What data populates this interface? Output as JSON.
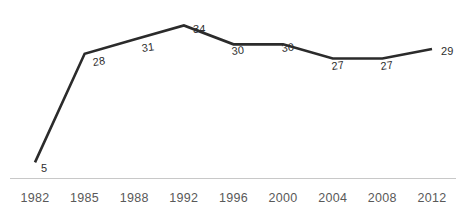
{
  "chart_data": {
    "type": "line",
    "title": "",
    "subtitle": "",
    "xlabel": "",
    "ylabel": "",
    "categories": [
      "1982",
      "1985",
      "1988",
      "1992",
      "1996",
      "2000",
      "2004",
      "2008",
      "2012"
    ],
    "values": [
      5,
      28,
      31,
      34,
      30,
      30,
      27,
      27,
      29
    ],
    "point_labels": [
      "5",
      "28",
      "31",
      "34",
      "30",
      "30",
      "27",
      "27",
      "29"
    ],
    "series": [
      {
        "name": "",
        "values": [
          5,
          28,
          31,
          34,
          30,
          30,
          27,
          27,
          29
        ]
      }
    ],
    "ylim": [
      0,
      36
    ],
    "grid": false,
    "legend": "none",
    "show_y_axis": false,
    "show_x_axis": true,
    "line_color": "#2b2b2b",
    "label_color": "#2e2e2e",
    "tick_color": "#595959",
    "axis_color": "#c8c8c8",
    "background_color": "#ffffff"
  },
  "axis": {
    "ticks": [
      {
        "label": "1982"
      },
      {
        "label": "1985"
      },
      {
        "label": "1988"
      },
      {
        "label": "1992"
      },
      {
        "label": "1996"
      },
      {
        "label": "2000"
      },
      {
        "label": "2004"
      },
      {
        "label": "2008"
      },
      {
        "label": "2012"
      }
    ]
  }
}
